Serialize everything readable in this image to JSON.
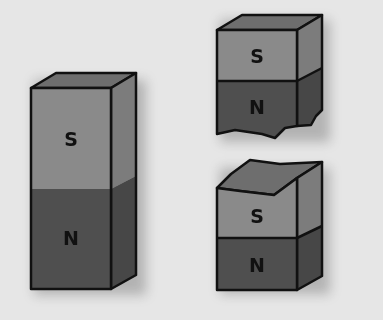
{
  "diagram": {
    "colors": {
      "background": "#e6e6e6",
      "south_front": "#8a8a8a",
      "south_side": "#7c7c7c",
      "north_front": "#4f4f4f",
      "north_side": "#474747",
      "top_face": "#6e6e6e",
      "outline": "#111111"
    },
    "magnets": [
      {
        "name": "whole-magnet",
        "south_label": "S",
        "north_label": "N"
      },
      {
        "name": "upper-broken-piece",
        "south_label": "S",
        "north_label": "N"
      },
      {
        "name": "lower-broken-piece",
        "south_label": "S",
        "north_label": "N"
      }
    ]
  }
}
